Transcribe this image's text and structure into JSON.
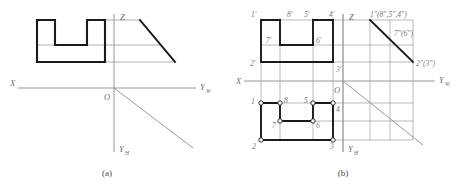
{
  "figure_a": {
    "caption": "(a)",
    "axis_labels": {
      "x": "X",
      "z": "Z",
      "yw": "Y",
      "yw_sub": "W",
      "yh": "Y",
      "yh_sub": "H",
      "origin": "O"
    }
  },
  "figure_b": {
    "caption": "(b)",
    "axis_labels": {
      "x": "X",
      "z": "Z",
      "yw": "Y",
      "yw_sub": "W",
      "yh": "Y",
      "yh_sub": "H",
      "origin": "O"
    },
    "v_labels": [
      "1'",
      "8'",
      "5'",
      "4'",
      "7'",
      "6'",
      "2'",
      "3'"
    ],
    "h_labels": [
      "1",
      "8",
      "5",
      "4",
      "7",
      "6",
      "2",
      "3"
    ],
    "w_labels": [
      "1\"(8\",5\",4\")",
      "7\"(6\")",
      "2\"(3\")"
    ]
  },
  "colors": {
    "object_line": "#1a1a1a",
    "thin_line": "#8c8c8c",
    "axis_line": "#8c8c8c",
    "label": "#6d6d6d",
    "background": "#ffffff"
  }
}
